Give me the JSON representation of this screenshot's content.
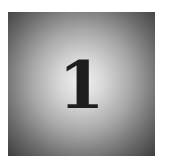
{
  "tile": {
    "numeral": "1",
    "gradient": {
      "center_color": "#f2f2f2",
      "edge_color": "#3e3e3e"
    },
    "numeral_color": "#1e1e1e"
  }
}
